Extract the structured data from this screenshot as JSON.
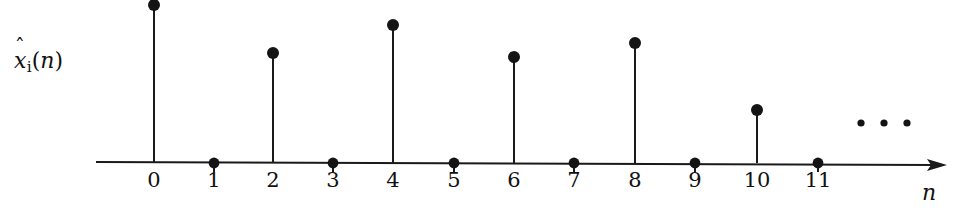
{
  "figure": {
    "kind": "stem-plot",
    "background_color": "#ffffff",
    "ink_color": "#141414"
  },
  "labels": {
    "y_axis": {
      "base": "x",
      "hat": "ˆ",
      "subscript": "i",
      "argument_open": "(",
      "argument": "n",
      "argument_close": ")",
      "plain": "x̂ᵢ(n)"
    },
    "x_axis": "n",
    "ellipsis": "· · ·"
  },
  "chart_data": {
    "type": "line",
    "plot_style": "stem",
    "title": "",
    "xlabel": "n",
    "ylabel": "x̂ᵢ(n)",
    "x": [
      0,
      1,
      2,
      3,
      4,
      5,
      6,
      7,
      8,
      9,
      10,
      11
    ],
    "values": [
      1.0,
      0.0,
      0.69,
      0.0,
      0.87,
      0.0,
      0.66,
      0.0,
      0.76,
      0.0,
      0.33,
      0.0
    ],
    "tick_labels": [
      "0",
      "1",
      "2",
      "3",
      "4",
      "5",
      "6",
      "7",
      "8",
      "9",
      "10",
      "11"
    ],
    "xlim": [
      -1.0,
      13.0
    ],
    "ylim": [
      0,
      1.05
    ],
    "grid": false,
    "legend": null,
    "annotations": [
      {
        "text": "· · ·",
        "x": 12.6,
        "y": 0.27,
        "note": "ellipsis indicating continuation"
      }
    ],
    "axis_arrow": "right",
    "markers": "filled-circle",
    "note": "Periodic discrete-time sequence; nonzero only at even n, decaying trend"
  },
  "geometry": {
    "axis_y": 163,
    "axis_x_start": 96,
    "axis_x_end": 947,
    "n_origin_x": 154,
    "n_spacing": 60.4,
    "marker_radius": 6.0,
    "zero_marker_radius": 5.4,
    "ellipsis_radius": 3.6,
    "stems": [
      {
        "n": 0,
        "x": 154,
        "top_y": 5,
        "nonzero": true
      },
      {
        "n": 1,
        "x": 214,
        "top_y": 163,
        "nonzero": false
      },
      {
        "n": 2,
        "x": 273,
        "top_y": 53,
        "nonzero": true
      },
      {
        "n": 3,
        "x": 333,
        "top_y": 163,
        "nonzero": false
      },
      {
        "n": 4,
        "x": 393,
        "top_y": 25,
        "nonzero": true
      },
      {
        "n": 5,
        "x": 454,
        "top_y": 163,
        "nonzero": false
      },
      {
        "n": 6,
        "x": 514,
        "top_y": 57,
        "nonzero": true
      },
      {
        "n": 7,
        "x": 574,
        "top_y": 163,
        "nonzero": false
      },
      {
        "n": 8,
        "x": 635,
        "top_y": 43,
        "nonzero": true
      },
      {
        "n": 9,
        "x": 695,
        "top_y": 163,
        "nonzero": false
      },
      {
        "n": 10,
        "x": 757,
        "top_y": 110,
        "nonzero": true
      },
      {
        "n": 11,
        "x": 818,
        "top_y": 163,
        "nonzero": false
      }
    ],
    "ellipsis_dots": [
      {
        "x": 861,
        "y": 123
      },
      {
        "x": 884,
        "y": 123
      },
      {
        "x": 907,
        "y": 123
      }
    ],
    "tick_label_y": 170
  }
}
